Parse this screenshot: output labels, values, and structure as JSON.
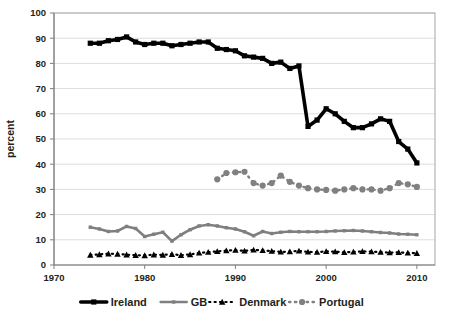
{
  "chart_data": {
    "type": "line",
    "title": "",
    "xlabel": "",
    "ylabel": "percent",
    "xlim": [
      1970,
      2012
    ],
    "ylim": [
      0,
      100
    ],
    "ytick_step": 10,
    "yticks": [
      0,
      10,
      20,
      30,
      40,
      50,
      60,
      70,
      80,
      90,
      100
    ],
    "xticks": [
      1970,
      1980,
      1990,
      2000,
      2010
    ],
    "xtick_labels": [
      "1970",
      "1980",
      "1990",
      "2000",
      "2010"
    ],
    "ytick_labels": [
      "0",
      "10",
      "20",
      "30",
      "40",
      "50",
      "60",
      "70",
      "80",
      "90",
      "100"
    ],
    "grid": "horizontal",
    "legend_position": "bottom",
    "plot_bg": "#ffffff",
    "grid_color": "#d9d9d9",
    "border_color": "#a6a6a6",
    "series": [
      {
        "name": "Ireland",
        "color": "#000000",
        "line_style": "solid",
        "marker": "square",
        "line_width": 3.6,
        "x": [
          1974,
          1975,
          1976,
          1977,
          1978,
          1979,
          1980,
          1981,
          1982,
          1983,
          1984,
          1985,
          1986,
          1987,
          1988,
          1989,
          1990,
          1991,
          1992,
          1993,
          1994,
          1995,
          1996,
          1997,
          1998,
          1999,
          2000,
          2001,
          2002,
          2003,
          2004,
          2005,
          2006,
          2007,
          2008,
          2009,
          2010
        ],
        "values": [
          88,
          88,
          89,
          89.5,
          90.5,
          88.5,
          87.5,
          88,
          88,
          87,
          87.5,
          88,
          88.5,
          88.5,
          86,
          85.5,
          85,
          83,
          82.5,
          82,
          80,
          80.5,
          78,
          79,
          55,
          57.5,
          62,
          60,
          57,
          54.5,
          54.5,
          56,
          58,
          57,
          49,
          46,
          40.5
        ]
      },
      {
        "name": "GB",
        "color": "#7f7f7f",
        "line_style": "solid",
        "marker": "small-square",
        "line_width": 2.6,
        "x": [
          1974,
          1975,
          1976,
          1977,
          1978,
          1979,
          1980,
          1981,
          1982,
          1983,
          1984,
          1985,
          1986,
          1987,
          1988,
          1989,
          1990,
          1991,
          1992,
          1993,
          1994,
          1995,
          1996,
          1997,
          1998,
          1999,
          2000,
          2001,
          2002,
          2003,
          2004,
          2005,
          2006,
          2007,
          2008,
          2009,
          2010
        ],
        "values": [
          15,
          14.3,
          13.3,
          13.5,
          15.3,
          14.5,
          11.3,
          12.2,
          13,
          9.5,
          12,
          14,
          15.5,
          16,
          15.5,
          14.8,
          14.3,
          13.2,
          11.6,
          13.3,
          12.5,
          13,
          13.3,
          13.2,
          13.2,
          13.2,
          13.3,
          13.5,
          13.6,
          13.7,
          13.5,
          13.2,
          12.9,
          12.7,
          12.3,
          12.2,
          12
        ]
      },
      {
        "name": "Denmark",
        "color": "#000000",
        "line_style": "dotted",
        "marker": "triangle",
        "line_width": 2.2,
        "x": [
          1974,
          1975,
          1976,
          1977,
          1978,
          1979,
          1980,
          1981,
          1982,
          1983,
          1984,
          1985,
          1986,
          1987,
          1988,
          1989,
          1990,
          1991,
          1992,
          1993,
          1994,
          1995,
          1996,
          1997,
          1998,
          1999,
          2000,
          2001,
          2002,
          2003,
          2004,
          2005,
          2006,
          2007,
          2008,
          2009,
          2010
        ],
        "values": [
          4,
          4.2,
          4.5,
          4.4,
          4.1,
          3.9,
          3.8,
          4.1,
          4,
          4.3,
          3.9,
          4.2,
          4.8,
          5.1,
          5.4,
          5.7,
          5.9,
          5.6,
          6,
          5.8,
          5.5,
          5.2,
          5.3,
          5.6,
          5.2,
          5.1,
          5.4,
          5.3,
          5,
          5.2,
          5.4,
          5.3,
          5.1,
          4.9,
          5,
          4.8,
          4.7
        ]
      },
      {
        "name": "Portugal",
        "color": "#808080",
        "line_style": "dotted",
        "marker": "circle",
        "line_width": 2.4,
        "x": [
          1988,
          1989,
          1990,
          1991,
          1992,
          1993,
          1994,
          1995,
          1996,
          1997,
          1998,
          1999,
          2000,
          2001,
          2002,
          2003,
          2004,
          2005,
          2006,
          2007,
          2008,
          2009,
          2010
        ],
        "values": [
          34,
          36.5,
          36.8,
          37,
          32.5,
          31.5,
          32.5,
          35.5,
          33,
          31.5,
          30.5,
          30,
          29.8,
          29.5,
          30,
          30.5,
          30,
          30,
          29.5,
          30.5,
          32.5,
          32,
          31
        ]
      }
    ]
  },
  "legend": {
    "items": [
      {
        "label": "Ireland"
      },
      {
        "label": "GB"
      },
      {
        "label": "Denmark"
      },
      {
        "label": "Portugal"
      }
    ]
  },
  "axes": {
    "y_axis_title": "percent"
  }
}
